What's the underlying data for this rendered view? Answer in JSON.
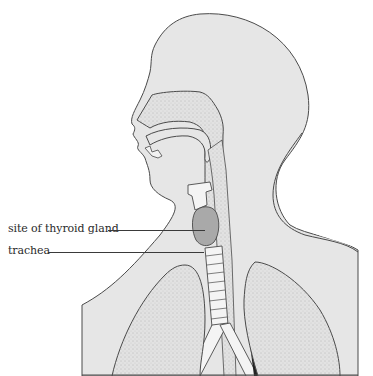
{
  "diagram": {
    "type": "anatomical-illustration",
    "colors": {
      "background": "#ffffff",
      "body_fill": "#e6e6e6",
      "stipple_fill": "#dcdcdc",
      "thyroid_fill": "#a9a9a9",
      "outline": "#4a4a4a",
      "airway_fill": "#f4f4f4"
    },
    "labels": [
      {
        "id": "thyroid",
        "text": "site of thyroid gland",
        "x": 8,
        "y": 223,
        "line_x1": 108,
        "line_x2": 205,
        "line_y": 230
      },
      {
        "id": "trachea",
        "text": "trachea",
        "x": 8,
        "y": 245,
        "line_x1": 47,
        "line_x2": 203,
        "line_y": 252
      }
    ]
  }
}
